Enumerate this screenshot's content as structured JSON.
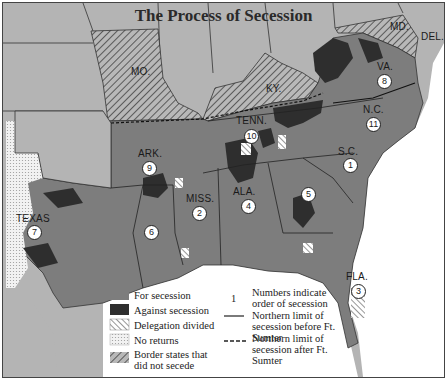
{
  "title": "The Process of Secession",
  "colors": {
    "for_secession": "#7d7d7d",
    "against_secession": "#2e2e2e",
    "non_seceding_land": "#b4b4b4",
    "water": "#ffffff",
    "border_states_hatch": "#6a6a6a"
  },
  "states": [
    {
      "abbr": "MO.",
      "category": "border"
    },
    {
      "abbr": "KY.",
      "category": "border"
    },
    {
      "abbr": "MD.",
      "category": "border"
    },
    {
      "abbr": "DEL.",
      "category": "border"
    },
    {
      "abbr": "VA.",
      "order": "8"
    },
    {
      "abbr": "N.C.",
      "order": "11"
    },
    {
      "abbr": "TENN.",
      "order": "10"
    },
    {
      "abbr": "ARK.",
      "order": "9"
    },
    {
      "abbr": "S.C.",
      "order": "1"
    },
    {
      "abbr": "MISS.",
      "order": "2"
    },
    {
      "abbr": "ALA.",
      "order": "4"
    },
    {
      "abbr": "GA.",
      "order": "5"
    },
    {
      "abbr": "LA.",
      "order": "6"
    },
    {
      "abbr": "TEXAS",
      "order": "7"
    },
    {
      "abbr": "FLA.",
      "order": "3"
    }
  ],
  "legend": {
    "for_secession": "For secession",
    "against_secession": "Against secession",
    "delegation_divided": "Delegation divided",
    "no_returns": "No returns",
    "border_states": "Border states that did not secede",
    "numbers_symbol": "1",
    "numbers_text": "Numbers indicate order of secession",
    "solid_line_text": "Northern limit of secession before Ft. Sumter",
    "dashed_line_text": "Northern limit of secession after Ft. Sumter"
  }
}
